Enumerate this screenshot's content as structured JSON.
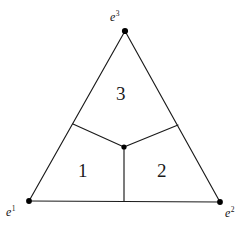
{
  "figure": {
    "background_color": "#ffffff",
    "line_color": "#1a1a1a",
    "text_color": "#141414"
  },
  "vertices": [
    {
      "id": "e1",
      "label_base": "e",
      "label_sup": "1",
      "x": 29,
      "y": 201
    },
    {
      "id": "e2",
      "label_base": "e",
      "label_sup": "2",
      "x": 220,
      "y": 202
    },
    {
      "id": "e3",
      "label_base": "e",
      "label_sup": "3",
      "x": 125,
      "y": 31
    }
  ],
  "interior_point": {
    "id": "center",
    "x": 124,
    "y": 147
  },
  "boundary_points": [
    {
      "id": "p-left-edge",
      "x": 73,
      "y": 124
    },
    {
      "id": "p-right-edge",
      "x": 178,
      "y": 125
    },
    {
      "id": "p-bottom-edge",
      "x": 124,
      "y": 201
    }
  ],
  "outer_edges": [
    {
      "id": "edge-left",
      "from": "e1",
      "to": "e3"
    },
    {
      "id": "edge-right",
      "from": "e3",
      "to": "e2"
    },
    {
      "id": "edge-bottom",
      "from": "e1",
      "to": "e2"
    }
  ],
  "inner_edges": [
    {
      "id": "inner-edge-to-left",
      "from": "center",
      "to": "p-left-edge"
    },
    {
      "id": "inner-edge-to-right",
      "from": "center",
      "to": "p-right-edge"
    },
    {
      "id": "inner-edge-to-bottom",
      "from": "center",
      "to": "p-bottom-edge"
    }
  ],
  "regions": [
    {
      "id": "region-1",
      "label": "1",
      "label_x": 84,
      "label_y": 172
    },
    {
      "id": "region-2",
      "label": "2",
      "label_x": 163,
      "label_y": 172
    },
    {
      "id": "region-3",
      "label": "3",
      "label_x": 122,
      "label_y": 94
    }
  ],
  "labels": {
    "e1": {
      "base": "e",
      "sup": "1"
    },
    "e2": {
      "base": "e",
      "sup": "2"
    },
    "e3": {
      "base": "e",
      "sup": "3"
    },
    "region_1": "1",
    "region_2": "2",
    "region_3": "3"
  }
}
